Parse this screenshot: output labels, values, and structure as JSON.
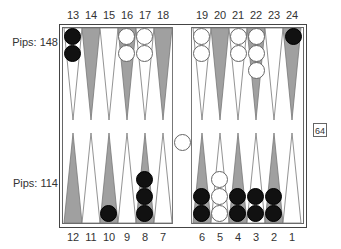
{
  "top_labels": [
    "13",
    "14",
    "15",
    "16",
    "17",
    "18",
    "19",
    "20",
    "21",
    "22",
    "23",
    "24"
  ],
  "bottom_labels": [
    "12",
    "11",
    "10",
    "9",
    "8",
    "7",
    "6",
    "5",
    "4",
    "3",
    "2",
    "1"
  ],
  "pips_top": "Pips: 148",
  "pips_bottom": "Pips: 114",
  "cube_value": "64",
  "colors": {
    "dark_point": "#a0a0a0",
    "light_point": "#ffffff",
    "black_checker": "#111111",
    "white_checker": "#ffffff"
  },
  "checkers": {
    "13": {
      "color": "black",
      "count": 2
    },
    "16": {
      "color": "white",
      "count": 2
    },
    "17": {
      "color": "white",
      "count": 2
    },
    "19": {
      "color": "white",
      "count": 2
    },
    "21": {
      "color": "white",
      "count": 2
    },
    "22": {
      "color": "white",
      "count": 3
    },
    "24": {
      "color": "black",
      "count": 1
    },
    "10": {
      "color": "black",
      "count": 1
    },
    "8": {
      "color": "black",
      "count": 3
    },
    "6": {
      "color": "black",
      "count": 2
    },
    "5": {
      "color": "white",
      "count": 3
    },
    "4": {
      "color": "black",
      "count": 2
    },
    "3": {
      "color": "black",
      "count": 2
    },
    "2": {
      "color": "black",
      "count": 2
    },
    "bar": {
      "color": "white",
      "count": 1
    }
  }
}
